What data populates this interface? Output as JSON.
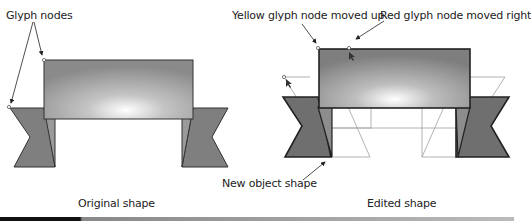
{
  "labels": {
    "glyph_nodes": "Glyph nodes",
    "yellow_node": "Yellow glyph node moved up",
    "red_node": "Red glyph node moved right",
    "new_object_shape": "New object shape",
    "original_caption": "Original shape",
    "edited_caption": "Edited shape"
  },
  "colors": {
    "banner_fill_dark": "#8a8a8a",
    "banner_fill_light": "#f2f2f2",
    "tail_fill": "#7d7d7d",
    "outline": "#333333",
    "ghost_outline": "#9a9a9a"
  }
}
